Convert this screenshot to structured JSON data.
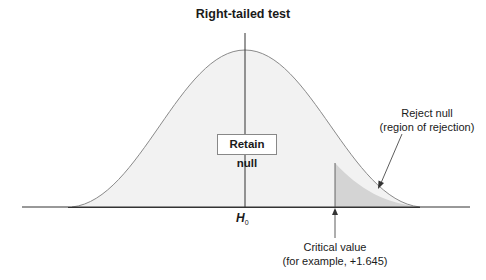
{
  "title": "Right-tailed test",
  "labels": {
    "retain": "Retain null",
    "mean_symbol": "H",
    "mean_subscript": "0",
    "reject_line1": "Reject null",
    "reject_line2": "(region of rejection)",
    "critical_line1": "Critical value",
    "critical_line2": "(for example, +1.645)"
  },
  "colors": {
    "curve_fill": "#f2f2f2",
    "tail_fill": "#d4d4d4",
    "curve_stroke": "#8a8a8a",
    "axis": "#333333"
  },
  "distribution": {
    "type": "normal",
    "tail": "right",
    "critical_value": 1.645
  }
}
